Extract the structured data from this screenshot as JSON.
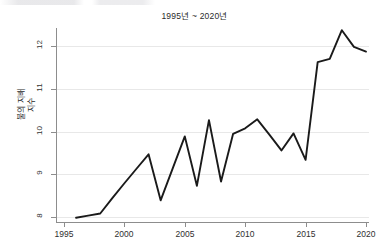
{
  "chart_data": {
    "type": "line",
    "title": "1995년 ~ 2020년",
    "xlabel": "",
    "ylabel": "불의 지배\n지수",
    "xlim": [
      1995,
      2020
    ],
    "ylim": [
      7.85,
      12.45
    ],
    "grid": true,
    "legend": "none",
    "xticks": [
      "1995",
      "2000",
      "2005",
      "2010",
      "2015",
      "2020"
    ],
    "xtick_values": [
      1995,
      2000,
      2005,
      2010,
      2015,
      2020
    ],
    "yticks": [
      "8",
      "9",
      "10",
      "11",
      "12"
    ],
    "ytick_values": [
      8,
      9,
      10,
      11,
      12
    ],
    "x": [
      1996,
      1997,
      1998,
      1999,
      2000,
      2001,
      2002,
      2003,
      2004,
      2005,
      2006,
      2007,
      2008,
      2009,
      2010,
      2011,
      2012,
      2013,
      2014,
      2015,
      2016,
      2017,
      2018,
      2019,
      2020
    ],
    "values": [
      7.97,
      8.02,
      8.07,
      8.43,
      8.78,
      9.12,
      9.46,
      8.38,
      9.13,
      9.88,
      8.72,
      10.26,
      8.82,
      9.94,
      10.07,
      10.28,
      9.92,
      9.55,
      9.95,
      9.33,
      11.62,
      11.7,
      12.37,
      11.98,
      11.87
    ],
    "series": [
      {
        "name": "불의 지배 지수",
        "values": [
          7.97,
          8.02,
          8.07,
          8.43,
          8.78,
          9.12,
          9.46,
          8.38,
          9.13,
          9.88,
          8.72,
          10.26,
          8.82,
          9.94,
          10.07,
          10.28,
          9.92,
          9.55,
          9.95,
          9.33,
          11.62,
          11.7,
          12.37,
          11.98,
          11.87
        ],
        "color": "#1a1a1a"
      }
    ]
  },
  "colors": {
    "line": "#1a1a1a",
    "grid": "#e8e8e8",
    "axis": "#8d8d8d",
    "text": "#2a2a2a",
    "background": "#ffffff"
  }
}
